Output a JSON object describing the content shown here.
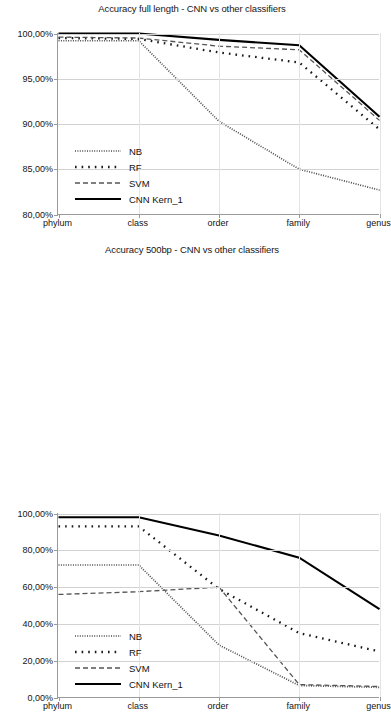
{
  "figure": {
    "width": 384,
    "height": 496,
    "background": "#ffffff"
  },
  "charts": [
    {
      "id": "chart-top",
      "title": "Accuracy full length - CNN vs other classifiers",
      "ylabels": [
        "100,00%",
        "95,00%",
        "90,00%",
        "85,00%",
        "80,00%"
      ],
      "xlabels": [
        "phylum",
        "class",
        "order",
        "family",
        "genus"
      ],
      "legend": [
        {
          "label": "NB",
          "style": "fine-dotted"
        },
        {
          "label": "RF",
          "style": "coarse-dotted"
        },
        {
          "label": "SVM",
          "style": "dashed"
        },
        {
          "label": "CNN Kern_1",
          "style": "solid"
        }
      ]
    },
    {
      "id": "chart-bot",
      "title": "Accuracy 500bp - CNN vs other classifiers",
      "ylabels": [
        "100,00%",
        "80,00%",
        "60,00%",
        "40,00%",
        "20,00%",
        "0,00%"
      ],
      "xlabels": [
        "phylum",
        "class",
        "order",
        "family",
        "genus"
      ],
      "legend": [
        {
          "label": "NB",
          "style": "fine-dotted"
        },
        {
          "label": "RF",
          "style": "coarse-dotted"
        },
        {
          "label": "SVM",
          "style": "dashed"
        },
        {
          "label": "CNN Kern_1",
          "style": "solid"
        }
      ]
    }
  ],
  "chart_data": [
    {
      "type": "line",
      "title": "Accuracy full length - CNN vs other classifiers",
      "xlabel": "",
      "ylabel": "",
      "categories": [
        "phylum",
        "class",
        "order",
        "family",
        "genus"
      ],
      "ylim": [
        80,
        100
      ],
      "yticks": [
        80,
        85,
        90,
        95,
        100
      ],
      "ytick_labels": [
        "80,00%",
        "85,00%",
        "90,00%",
        "95,00%",
        "100,00%"
      ],
      "grid": true,
      "legend_position": "inside-lower-left",
      "series": [
        {
          "name": "NB",
          "style": "fine-dotted",
          "color": "#4d4d4d",
          "values": [
            99.2,
            99.2,
            90.3,
            85.0,
            82.7
          ]
        },
        {
          "name": "RF",
          "style": "coarse-dotted",
          "color": "#1a1a1a",
          "values": [
            99.5,
            99.4,
            97.9,
            96.8,
            89.4
          ]
        },
        {
          "name": "SVM",
          "style": "dashed",
          "color": "#555555",
          "values": [
            99.6,
            99.5,
            98.6,
            98.2,
            90.4
          ]
        },
        {
          "name": "CNN Kern_1",
          "style": "solid",
          "color": "#000000",
          "values": [
            100.0,
            100.0,
            99.3,
            98.7,
            90.8
          ]
        }
      ]
    },
    {
      "type": "line",
      "title": "Accuracy 500bp - CNN vs other classifiers",
      "xlabel": "",
      "ylabel": "",
      "categories": [
        "phylum",
        "class",
        "order",
        "family",
        "genus"
      ],
      "ylim": [
        0,
        100
      ],
      "yticks": [
        0,
        20,
        40,
        60,
        80,
        100
      ],
      "ytick_labels": [
        "0,00%",
        "20,00%",
        "40,00%",
        "60,00%",
        "80,00%",
        "100,00%"
      ],
      "grid": true,
      "legend_position": "inside-lower-left",
      "series": [
        {
          "name": "NB",
          "style": "fine-dotted",
          "color": "#4d4d4d",
          "values": [
            72.0,
            72.0,
            28.5,
            6.5,
            5.5
          ]
        },
        {
          "name": "RF",
          "style": "coarse-dotted",
          "color": "#1a1a1a",
          "values": [
            93.0,
            93.0,
            59.0,
            35.0,
            25.0
          ]
        },
        {
          "name": "SVM",
          "style": "dashed",
          "color": "#555555",
          "values": [
            56.0,
            57.5,
            60.0,
            7.0,
            6.0
          ]
        },
        {
          "name": "CNN Kern_1",
          "style": "solid",
          "color": "#000000",
          "values": [
            98.0,
            98.0,
            88.0,
            76.0,
            48.0
          ]
        }
      ]
    }
  ]
}
